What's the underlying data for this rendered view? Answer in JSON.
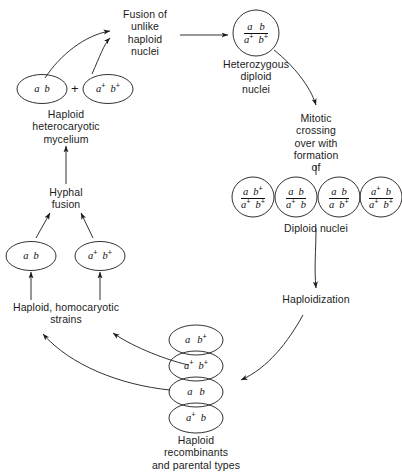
{
  "figure": {
    "background_color": "#ffffff",
    "stroke_color": "#1b1b1b",
    "width": 401,
    "height": 473
  },
  "labels": {
    "fusion_of_unlike_haploid_nuclei": "Fusion of\nunlike\nhaploid\nnuclei",
    "heterozygous_diploid_nuclei": "Heterozygous\ndiploid\nnuclei",
    "mitotic_crossing_over": "Mitotic\ncrossing\nover with\nformation\nof",
    "diploid_nuclei": "Diploid nuclei",
    "haploidization": "Haploidization",
    "haploid_recombinants": "Haploid\nrecombinants\nand parental types",
    "haploid_homocaryotic_strains": "Haploid, homocaryotic\nstrains",
    "hyphal_fusion": "Hyphal\nfusion",
    "haploid_heterocaryotic_mycelium": "Haploid\nheterocaryotic\nmycelium",
    "plus_operator": "+"
  },
  "nuclei": {
    "heterocaryotic_pair": [
      {
        "name": "a-b",
        "top": "a b",
        "bottom": ""
      },
      {
        "name": "a-plus-b-plus",
        "top": "a+ b+",
        "bottom": ""
      }
    ],
    "heterozygous_diploid": {
      "numerator": "a  b",
      "denominator": "a+ b+"
    },
    "diploid_products": [
      {
        "numerator": "a  b+",
        "denominator": "a+ b+"
      },
      {
        "numerator": "a  b",
        "denominator": "a+ b"
      },
      {
        "numerator": "a  b",
        "denominator": "a  b+"
      },
      {
        "numerator": "a+ b",
        "denominator": "a+ b+"
      }
    ],
    "haploid_products": [
      {
        "genotype": "a  b+"
      },
      {
        "genotype": "a+ b+"
      },
      {
        "genotype": "a  b"
      },
      {
        "genotype": "a+ b"
      }
    ],
    "homocaryotic_strains": [
      {
        "genotype": "a b"
      },
      {
        "genotype": "a+ b+"
      }
    ]
  }
}
